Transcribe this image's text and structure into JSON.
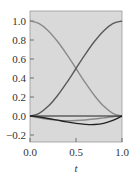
{
  "chart_data": {
    "type": "line",
    "title": "",
    "xlabel": "t",
    "ylabel": "",
    "xlim": [
      0.0,
      1.0
    ],
    "ylim": [
      -0.27,
      1.1
    ],
    "grid": false,
    "legend": null,
    "xticks": [
      "0.0",
      "0.5",
      "1.0"
    ],
    "yticks": [
      "1.0",
      "0.8",
      "0.6",
      "0.4",
      "0.2",
      "0.0",
      "-0.2"
    ],
    "x": [
      0.0,
      0.1,
      0.2,
      0.3,
      0.4,
      0.5,
      0.6,
      0.7,
      0.8,
      0.9,
      1.0
    ],
    "series": [
      {
        "name": "h00",
        "color": "#8a8a8a",
        "values": [
          1.0,
          0.972,
          0.896,
          0.784,
          0.648,
          0.5,
          0.352,
          0.216,
          0.104,
          0.028,
          0.0
        ]
      },
      {
        "name": "h01",
        "color": "#5a5a5a",
        "values": [
          0.0,
          0.028,
          0.104,
          0.216,
          0.352,
          0.5,
          0.648,
          0.784,
          0.896,
          0.972,
          1.0
        ]
      },
      {
        "name": "h10",
        "color": "#8a8a8a",
        "values": [
          0.0,
          -0.02,
          -0.036,
          -0.046,
          -0.05,
          -0.048,
          -0.042,
          -0.032,
          -0.02,
          -0.008,
          0.0
        ]
      },
      {
        "name": "h11",
        "color": "#222222",
        "values": [
          0.0,
          -0.01,
          -0.026,
          -0.044,
          -0.062,
          -0.078,
          -0.088,
          -0.09,
          -0.078,
          -0.046,
          0.0
        ]
      },
      {
        "name": "zero",
        "color": "#222222",
        "values": [
          0.0,
          0.0,
          0.0,
          0.0,
          0.0,
          0.0,
          0.0,
          0.0,
          0.0,
          0.0,
          0.0
        ]
      }
    ]
  },
  "plot": {
    "background": "#d9d9d9",
    "frame_color": "#888888"
  }
}
